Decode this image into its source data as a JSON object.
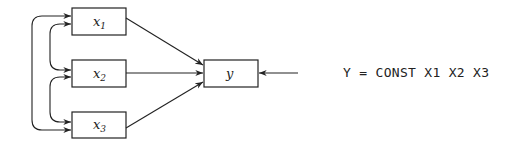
{
  "diagram": {
    "nodes": [
      {
        "id": "x1",
        "base": "x",
        "sub": "1"
      },
      {
        "id": "x2",
        "base": "x",
        "sub": "2"
      },
      {
        "id": "x3",
        "base": "x",
        "sub": "3"
      },
      {
        "id": "y",
        "base": "y",
        "sub": ""
      }
    ],
    "edges": [
      {
        "from": "x1",
        "to": "y",
        "type": "directed"
      },
      {
        "from": "x2",
        "to": "y",
        "type": "directed"
      },
      {
        "from": "x3",
        "to": "y",
        "type": "directed"
      },
      {
        "from": "error",
        "to": "y",
        "type": "directed"
      },
      {
        "from": "x1",
        "to": "x2",
        "type": "bidirected-curved"
      },
      {
        "from": "x2",
        "to": "x3",
        "type": "bidirected-curved"
      },
      {
        "from": "x1",
        "to": "x3",
        "type": "bidirected-curved"
      }
    ],
    "model_statement": "Y = CONST X1 X2 X3"
  }
}
